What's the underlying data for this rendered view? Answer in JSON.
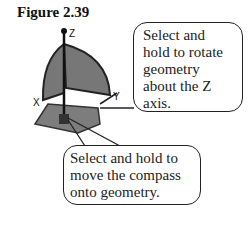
{
  "figure": {
    "title": "Figure 2.39",
    "axis_labels": {
      "z": "Z",
      "x": "X",
      "y": "Y"
    }
  },
  "callouts": [
    {
      "lines": [
        "Select and",
        "hold to rotate",
        "geometry",
        "about the Z",
        "axis."
      ]
    },
    {
      "lines": [
        "Select and hold to",
        "move the compass",
        "onto geometry."
      ]
    }
  ],
  "colors": {
    "fill": "#7a7a7a",
    "stroke": "#222222"
  }
}
